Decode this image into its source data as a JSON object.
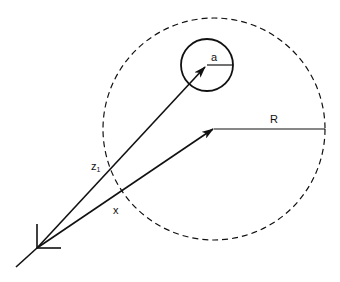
{
  "diagram": {
    "labels": {
      "small_radius": "a",
      "large_radius": "R",
      "vector_z": "z",
      "vector_z_subscript": "1",
      "vector_x": "x"
    },
    "colors": {
      "stroke": "#111111",
      "background": "#ffffff"
    },
    "large_circle": {
      "cx": 214,
      "cy": 129,
      "r": 111,
      "style": "dashed"
    },
    "small_circle": {
      "cx": 207,
      "cy": 65,
      "r": 26,
      "style": "solid"
    },
    "origin": {
      "x": 37,
      "y": 248
    }
  }
}
